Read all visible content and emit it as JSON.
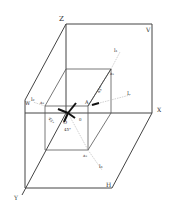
{
  "diagram": {
    "labels": {
      "Z": "Z",
      "V": "V",
      "X": "X",
      "Y": "Y",
      "H": "H",
      "W": "W",
      "O": "O",
      "A": "A",
      "a1": "a₁",
      "a2": "a₂",
      "a3": "a₃",
      "l1": "l₁",
      "l2": "l₂",
      "l3": "l₃",
      "L": "L",
      "angle1": "45°",
      "angle2": "45°",
      "angle3": "45°",
      "theta": "θ"
    },
    "colors": {
      "line": "#444444",
      "light_line": "#bbbbbb",
      "arrow": "#111111"
    }
  }
}
